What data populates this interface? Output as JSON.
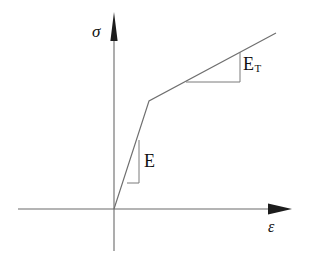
{
  "figure": {
    "kind": "bilinear-stress-strain-diagram",
    "background_color": "#ffffff",
    "line_color": "#6a6a6a",
    "arrow_color": "#1d1d1d",
    "text_color": "#111111",
    "labels": {
      "y_axis": "σ",
      "x_axis": "ε",
      "elastic_modulus": "E",
      "tangent_modulus_base": "E",
      "tangent_modulus_subscript": "T"
    }
  },
  "chart_data": {
    "type": "line",
    "title": "",
    "xlabel": "ε",
    "ylabel": "σ",
    "grid": false,
    "legend": null,
    "axes": {
      "origin_px": [
        114,
        209
      ],
      "x_axis_px": [
        [
          18,
          209
        ],
        [
          292,
          209
        ]
      ],
      "y_axis_px": [
        [
          114,
          251
        ],
        [
          114,
          12
        ]
      ],
      "x_arrow_tip_px": [
        292,
        209
      ],
      "y_arrow_tip_px": [
        114,
        12
      ]
    },
    "series": [
      {
        "name": "bilinear stress-strain curve",
        "points_px": [
          [
            114,
            209
          ],
          [
            149,
            101
          ],
          [
            276,
            33
          ]
        ],
        "segments": [
          {
            "name": "elastic",
            "slope_label": "E",
            "from_px": [
              114,
              209
            ],
            "to_px": [
              149,
              101
            ]
          },
          {
            "name": "strain-hardening",
            "slope_label": "E_T",
            "from_px": [
              149,
              101
            ],
            "to_px": [
              276,
              33
            ]
          }
        ]
      }
    ],
    "annotations": [
      {
        "name": "elastic-slope-triangle",
        "label": "E",
        "vertical_leg_px": [
          [
            139,
            140
          ],
          [
            139,
            183
          ]
        ],
        "horizontal_leg_px": [
          [
            127,
            183
          ],
          [
            139,
            183
          ]
        ],
        "label_px": [
          145,
          152
        ]
      },
      {
        "name": "tangent-slope-triangle",
        "label": "E_T",
        "vertical_leg_px": [
          [
            240,
            52
          ],
          [
            240,
            82
          ]
        ],
        "horizontal_leg_px": [
          [
            186,
            82
          ],
          [
            240,
            82
          ]
        ],
        "label_px": [
          244,
          55
        ]
      }
    ]
  }
}
